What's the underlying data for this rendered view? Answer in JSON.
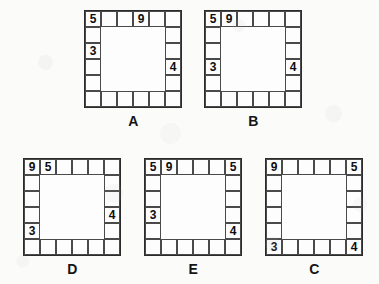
{
  "page": {
    "kind": "logic-puzzle-answer-choices",
    "background_color": "#fbfbfa",
    "ink_color": "#0d0d0d",
    "grid_line_color": "#4a4a4a",
    "grid_border_color": "#2b2b2b",
    "grid_size": 6,
    "cell_px": 16
  },
  "figures": [
    {
      "id": "A",
      "label": "A",
      "position": {
        "left": 84,
        "top": 10
      },
      "entries": [
        {
          "row": 1,
          "col": 1,
          "value": "5"
        },
        {
          "row": 1,
          "col": 4,
          "value": "9"
        },
        {
          "row": 3,
          "col": 1,
          "value": "3"
        },
        {
          "row": 4,
          "col": 6,
          "value": "4"
        }
      ]
    },
    {
      "id": "B",
      "label": "B",
      "position": {
        "left": 204,
        "top": 10
      },
      "entries": [
        {
          "row": 1,
          "col": 1,
          "value": "5"
        },
        {
          "row": 1,
          "col": 2,
          "value": "9"
        },
        {
          "row": 4,
          "col": 1,
          "value": "3"
        },
        {
          "row": 4,
          "col": 6,
          "value": "4"
        }
      ]
    },
    {
      "id": "D",
      "label": "D",
      "position": {
        "left": 23,
        "top": 158
      },
      "entries": [
        {
          "row": 1,
          "col": 1,
          "value": "9"
        },
        {
          "row": 1,
          "col": 2,
          "value": "5"
        },
        {
          "row": 4,
          "col": 6,
          "value": "4"
        },
        {
          "row": 5,
          "col": 1,
          "value": "3"
        }
      ]
    },
    {
      "id": "E",
      "label": "E",
      "position": {
        "left": 144,
        "top": 158
      },
      "entries": [
        {
          "row": 1,
          "col": 1,
          "value": "5"
        },
        {
          "row": 1,
          "col": 2,
          "value": "9"
        },
        {
          "row": 1,
          "col": 6,
          "value": "5"
        },
        {
          "row": 4,
          "col": 1,
          "value": "3"
        },
        {
          "row": 5,
          "col": 6,
          "value": "4"
        }
      ]
    },
    {
      "id": "C",
      "label": "C",
      "position": {
        "left": 265,
        "top": 158
      },
      "entries": [
        {
          "row": 1,
          "col": 1,
          "value": "9"
        },
        {
          "row": 1,
          "col": 6,
          "value": "5"
        },
        {
          "row": 6,
          "col": 1,
          "value": "3"
        },
        {
          "row": 6,
          "col": 6,
          "value": "4"
        }
      ]
    }
  ]
}
